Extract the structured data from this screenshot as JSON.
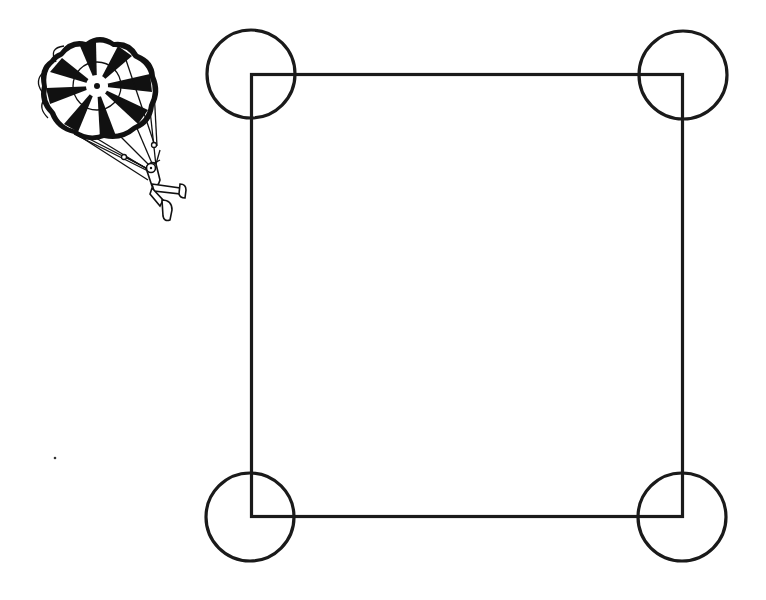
{
  "figure": {
    "description": "Parachutist clip art beside a square with a circle centered on each corner",
    "background": "#ffffff",
    "line_color": "#1a1a1a"
  },
  "square": {
    "x1": 251.5,
    "y1": 74.5,
    "x2": 682.5,
    "y2": 516.5,
    "stroke_width": 3.2
  },
  "corner_circles": [
    {
      "name": "top-left",
      "cx": 251,
      "cy": 74,
      "r": 44
    },
    {
      "name": "top-right",
      "cx": 683,
      "cy": 75,
      "r": 44
    },
    {
      "name": "bottom-left",
      "cx": 250,
      "cy": 517,
      "r": 44
    },
    {
      "name": "bottom-right",
      "cx": 682,
      "cy": 517,
      "r": 44
    }
  ],
  "parachutist": {
    "icon": "parachute-icon",
    "canopy_center": [
      97,
      86
    ],
    "canopy_radius": 56
  },
  "stray_dot": {
    "cx": 55,
    "cy": 458,
    "r": 1.3
  }
}
